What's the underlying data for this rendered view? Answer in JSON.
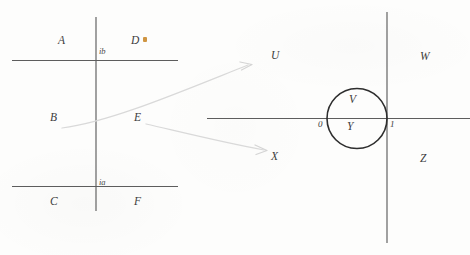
{
  "figure": {
    "background_color": "#fdfdfc",
    "ink_color": "#3c3c3c",
    "axis_color": "#5d5d5d",
    "arrow_color": "#d9d9d9",
    "accent_mark_color": "#cf9542"
  },
  "left_plane": {
    "name": "source-plane",
    "vertical_axis_label_top": "ib",
    "vertical_axis_label_bottom": "ia",
    "regions": [
      {
        "id": "A",
        "label": "A"
      },
      {
        "id": "B",
        "label": "B"
      },
      {
        "id": "C",
        "label": "C"
      },
      {
        "id": "D",
        "label": "D"
      },
      {
        "id": "E",
        "label": "E"
      },
      {
        "id": "F",
        "label": "F"
      }
    ]
  },
  "right_plane": {
    "name": "image-plane",
    "tick_labels": [
      {
        "id": "zero",
        "label": "0"
      },
      {
        "id": "one",
        "label": "1"
      }
    ],
    "regions": [
      {
        "id": "U",
        "label": "U"
      },
      {
        "id": "V",
        "label": "V"
      },
      {
        "id": "W",
        "label": "W"
      },
      {
        "id": "X",
        "label": "X"
      },
      {
        "id": "Y",
        "label": "Y"
      },
      {
        "id": "Z",
        "label": "Z"
      }
    ]
  },
  "mappings": [
    {
      "id": "b-to-u",
      "from": "B",
      "to": "U"
    },
    {
      "id": "e-to-x",
      "from": "E",
      "to": "X"
    }
  ]
}
